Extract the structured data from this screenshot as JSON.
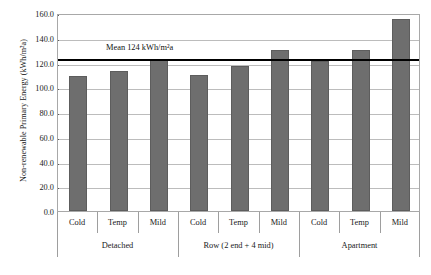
{
  "chart_data": {
    "type": "bar",
    "title": "",
    "xlabel": "",
    "ylabel": "Non-renewable Primary Energy (kWh/m²a)",
    "ylim": [
      0,
      160
    ],
    "ytick_step": 20,
    "ytick_labels": [
      "0.0",
      "20.0",
      "40.0",
      "60.0",
      "80.0",
      "100.0",
      "120.0",
      "140.0",
      "160.0"
    ],
    "ytick_values": [
      0,
      20,
      40,
      60,
      80,
      100,
      120,
      140,
      160
    ],
    "grid": true,
    "grid_axis": "y",
    "legend": "none",
    "categories": [
      "Cold",
      "Temp",
      "Mild",
      "Cold",
      "Temp",
      "Mild",
      "Cold",
      "Temp",
      "Mild"
    ],
    "values": [
      109,
      113,
      122,
      110,
      117,
      130,
      121,
      130,
      155
    ],
    "bars": [
      {
        "group": "Detached",
        "category": "Cold",
        "value": 109
      },
      {
        "group": "Detached",
        "category": "Temp",
        "value": 113
      },
      {
        "group": "Detached",
        "category": "Mild",
        "value": 122
      },
      {
        "group": "Row (2 end + 4 mid)",
        "category": "Cold",
        "value": 110
      },
      {
        "group": "Row (2 end + 4 mid)",
        "category": "Temp",
        "value": 117
      },
      {
        "group": "Row (2 end + 4 mid)",
        "category": "Mild",
        "value": 130
      },
      {
        "group": "Apartment",
        "category": "Cold",
        "value": 121
      },
      {
        "group": "Apartment",
        "category": "Temp",
        "value": 130
      },
      {
        "group": "Apartment",
        "category": "Mild",
        "value": 155
      }
    ],
    "groups": [
      {
        "label": "Detached",
        "span": 3
      },
      {
        "label": "Row (2 end + 4 mid)",
        "span": 3
      },
      {
        "label": "Apartment",
        "span": 3
      }
    ],
    "annotations": [
      {
        "name": "mean-line",
        "label": "Mean 124 kWh/m²a",
        "value": 124,
        "type": "horizontal-line"
      }
    ],
    "colors": {
      "bar_fill": "#6e6e6e",
      "bar_edge": "#5d5d5d",
      "mean_line": "#000000",
      "grid": "#bcbcbc",
      "frame": "#a8a8a8",
      "text": "#1a1a1a",
      "background": "#ffffff"
    }
  }
}
